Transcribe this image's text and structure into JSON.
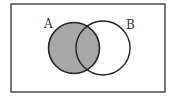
{
  "diagram": {
    "type": "venn",
    "universe": {
      "shape": "rectangle"
    },
    "sets": [
      {
        "label": "A",
        "shaded": true
      },
      {
        "label": "B",
        "shaded": false
      }
    ],
    "shaded_region": "A",
    "colors": {
      "shade": "#a8a8a8",
      "stroke": "#222222",
      "background": "#ffffff"
    }
  }
}
